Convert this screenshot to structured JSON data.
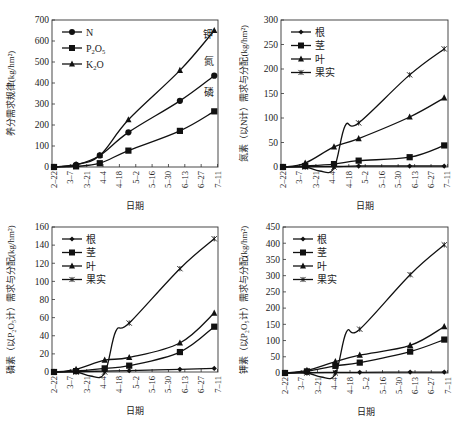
{
  "chart_data": [
    {
      "id": "total",
      "type": "line",
      "title": "",
      "xlabel": "日期",
      "ylabel": "养分需求规律(kg/hm²)",
      "ylim": [
        0,
        700
      ],
      "yticks": [
        0,
        100,
        200,
        300,
        400,
        500,
        600,
        700
      ],
      "x_tick_labels": [
        "2–22",
        "3–7",
        "3–21",
        "4–4",
        "4–18",
        "5–2",
        "5–16",
        "5–30",
        "6–13",
        "6–27",
        "7–11"
      ],
      "x_point_positions": [
        0,
        1.35,
        2.8,
        4.55,
        7.7,
        9.8
      ],
      "grid": false,
      "legend_position": "upper-left",
      "series": [
        {
          "name": "N",
          "marker": "circle",
          "values": [
            0,
            10,
            55,
            165,
            315,
            435
          ]
        },
        {
          "name": "P2O5",
          "label_main": "P",
          "label_sub1": "2",
          "label_mid": "O",
          "label_sub2": "5",
          "marker": "square",
          "values": [
            0,
            3,
            18,
            78,
            172,
            265
          ]
        },
        {
          "name": "K2O",
          "label_main": "K",
          "label_sub1": "2",
          "label_mid": "O",
          "label_sub2": "",
          "marker": "triangle",
          "values": [
            0,
            12,
            55,
            225,
            460,
            650
          ]
        }
      ],
      "annotations": [
        {
          "text": "钾",
          "x": 9.1,
          "y": 615
        },
        {
          "text": "氮",
          "x": 9.2,
          "y": 485
        },
        {
          "text": "磷",
          "x": 9.2,
          "y": 340
        }
      ]
    },
    {
      "id": "nitrogen",
      "type": "line",
      "title": "",
      "xlabel": "日期",
      "ylabel": "氮素（以N计）需求与分配(kg/hm²)",
      "ylim": [
        0,
        300
      ],
      "yticks": [
        0,
        50,
        100,
        150,
        200,
        250,
        300
      ],
      "x_tick_labels": [
        "2–22",
        "3–7",
        "3–21",
        "4–4",
        "4–18",
        "5–2",
        "5–16",
        "5–30",
        "6–13",
        "6–27",
        "7–11"
      ],
      "x_point_positions": [
        0,
        1.35,
        3.1,
        4.6,
        7.7,
        9.8
      ],
      "grid": false,
      "legend_position": "upper-left",
      "series": [
        {
          "name": "根",
          "marker": "diamond",
          "values": [
            0,
            1,
            1,
            2,
            2,
            2
          ]
        },
        {
          "name": "茎",
          "marker": "square",
          "values": [
            0,
            2,
            6,
            13,
            20,
            44
          ]
        },
        {
          "name": "叶",
          "marker": "triangle",
          "values": [
            0,
            8,
            41,
            58,
            102,
            141
          ]
        },
        {
          "name": "果实",
          "marker": "x-star",
          "values": [
            0,
            0,
            0,
            90,
            188,
            241
          ]
        }
      ]
    },
    {
      "id": "phosphorus",
      "type": "line",
      "title": "",
      "xlabel": "日期",
      "ylabel": "磷素（以P₂O₅计）需求与分配(kg/hm²)",
      "ylim": [
        0,
        160
      ],
      "yticks": [
        0,
        20,
        40,
        60,
        80,
        100,
        120,
        140,
        160
      ],
      "x_tick_labels": [
        "2–22",
        "3–7",
        "3–21",
        "4–4",
        "4–18",
        "5–2",
        "5–16",
        "5–30",
        "6–13",
        "6–27",
        "7–11"
      ],
      "x_point_positions": [
        0,
        1.35,
        3.1,
        4.6,
        7.7,
        9.8
      ],
      "grid": false,
      "legend_position": "upper-left",
      "series": [
        {
          "name": "根",
          "marker": "diamond",
          "values": [
            0,
            0.5,
            1,
            1.5,
            3,
            4
          ]
        },
        {
          "name": "茎",
          "marker": "square",
          "values": [
            0,
            1,
            4,
            7,
            22,
            50
          ]
        },
        {
          "name": "叶",
          "marker": "triangle",
          "values": [
            0,
            3,
            13,
            16,
            32,
            65
          ]
        },
        {
          "name": "果实",
          "marker": "x-star",
          "values": [
            0,
            0,
            0,
            54,
            114,
            147
          ]
        }
      ]
    },
    {
      "id": "potassium",
      "type": "line",
      "title": "",
      "xlabel": "日期",
      "ylabel": "钾素（以P₂O₅计）需求与分配(kg/hm²)",
      "ylim": [
        0,
        450
      ],
      "yticks": [
        0,
        50,
        100,
        150,
        200,
        250,
        300,
        350,
        400,
        450
      ],
      "x_tick_labels": [
        "2–22",
        "3–7",
        "3–21",
        "4–4",
        "4–18",
        "5–2",
        "5–16",
        "5–30",
        "6–13",
        "6–27",
        "7–11"
      ],
      "x_point_positions": [
        0,
        1.35,
        3.1,
        4.6,
        7.7,
        9.8
      ],
      "grid": false,
      "legend_position": "upper-left",
      "series": [
        {
          "name": "根",
          "marker": "diamond",
          "values": [
            0,
            1,
            2,
            2,
            3,
            3
          ]
        },
        {
          "name": "茎",
          "marker": "square",
          "values": [
            0,
            5,
            22,
            32,
            66,
            103
          ]
        },
        {
          "name": "叶",
          "marker": "triangle",
          "values": [
            0,
            8,
            35,
            55,
            85,
            143
          ]
        },
        {
          "name": "果实",
          "marker": "x-star",
          "values": [
            0,
            0,
            0,
            135,
            303,
            395
          ]
        }
      ]
    }
  ]
}
